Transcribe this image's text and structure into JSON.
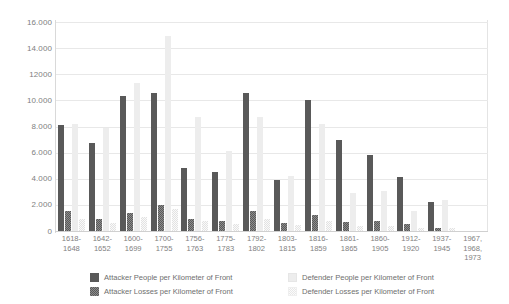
{
  "chart_data": {
    "type": "bar",
    "title": "",
    "xlabel": "",
    "ylabel": "",
    "ylim": [
      0,
      16000
    ],
    "grid": true,
    "legend_position": "bottom",
    "ytick_labels": [
      "16.000",
      "14.000",
      "12000",
      "10.000",
      "8.000",
      "6.000",
      "4.000",
      "2.000",
      "0"
    ],
    "ytick_values": [
      16000,
      14000,
      12000,
      10000,
      8000,
      6000,
      4000,
      2000,
      0
    ],
    "categories": [
      "1618-\n1648",
      "1642-\n1652",
      "1600-\n1699",
      "1700-\n1755",
      "1756-\n1763",
      "1775-\n1783",
      "1792-\n1802",
      "1803-\n1815",
      "1816-\n1859",
      "1861-\n1865",
      "1860-\n1905",
      "1912-\n1920",
      "1937-\n1945",
      "1967,\n1968,\n1973"
    ],
    "series": [
      {
        "name": "Attacker People per Kilometer of Front",
        "color": "#595959",
        "pattern": "solid",
        "values": [
          8100,
          6700,
          10300,
          10600,
          4800,
          4500,
          10600,
          3900,
          10050,
          6950,
          5800,
          4100,
          2200,
          0
        ]
      },
      {
        "name": "Attacker Losses per Kilometer of Front",
        "color": "#8c8c8c",
        "pattern": "checkered",
        "values": [
          1550,
          900,
          1400,
          2000,
          900,
          750,
          1550,
          600,
          1200,
          700,
          750,
          500,
          250,
          0
        ]
      },
      {
        "name": "Defender People per Kilometer of Front",
        "color": "#ededed",
        "pattern": "solid",
        "values": [
          8200,
          7900,
          11300,
          14900,
          8700,
          6100,
          8700,
          4200,
          8200,
          2900,
          3100,
          1500,
          2400,
          0
        ]
      },
      {
        "name": "Defender Losses per Kilometer of Front",
        "color": "#fafafa",
        "pattern": "checkered",
        "values": [
          950,
          650,
          1100,
          1700,
          750,
          550,
          900,
          450,
          800,
          350,
          400,
          250,
          200,
          0
        ]
      }
    ]
  },
  "legend": {
    "items": [
      {
        "label": "Attacker People per Kilometer of Front",
        "swatch": "sw-ap"
      },
      {
        "label": "Defender People per Kilometer of Front",
        "swatch": "sw-dp"
      },
      {
        "label": "Attacker Losses per Kilometer of Front",
        "swatch": "sw-al"
      },
      {
        "label": "Defender Losses per Kilometer of Front",
        "swatch": "sw-dl"
      }
    ]
  }
}
